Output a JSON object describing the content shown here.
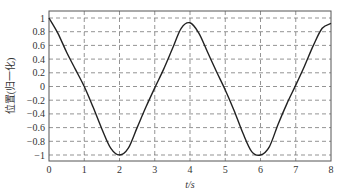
{
  "chart_data": {
    "type": "line",
    "title": "",
    "xlabel": "t/s",
    "ylabel": "位置(归一化)",
    "xlim": [
      0,
      8
    ],
    "ylim": [
      -1.1,
      1.05
    ],
    "grid": true,
    "grid_style": "dashed",
    "x_ticks": [
      "0",
      "1",
      "2",
      "3",
      "4",
      "5",
      "6",
      "7",
      "8"
    ],
    "y_ticks": [
      "1",
      "0.8",
      "0.6",
      "0.4",
      "0.2",
      "0",
      "-0.2",
      "-0.4",
      "-0.6",
      "-0.8",
      "-1"
    ],
    "series": [
      {
        "name": "position",
        "color": "#222222",
        "x": [
          0,
          0.25,
          0.5,
          0.75,
          1.0,
          1.25,
          1.5,
          1.75,
          2.0,
          2.25,
          2.5,
          2.75,
          3.0,
          3.25,
          3.5,
          3.75,
          4.0,
          4.25,
          4.5,
          4.75,
          5.0,
          5.25,
          5.5,
          5.75,
          6.0,
          6.25,
          6.5,
          6.75,
          7.0,
          7.25,
          7.5,
          7.75,
          8.0
        ],
        "y": [
          1.0,
          0.78,
          0.5,
          0.25,
          0.0,
          -0.3,
          -0.62,
          -0.9,
          -1.0,
          -0.9,
          -0.6,
          -0.3,
          -0.02,
          0.25,
          0.55,
          0.85,
          0.93,
          0.78,
          0.5,
          0.22,
          -0.05,
          -0.35,
          -0.68,
          -0.95,
          -1.0,
          -0.88,
          -0.55,
          -0.25,
          0.02,
          0.3,
          0.6,
          0.85,
          0.92
        ]
      }
    ]
  }
}
